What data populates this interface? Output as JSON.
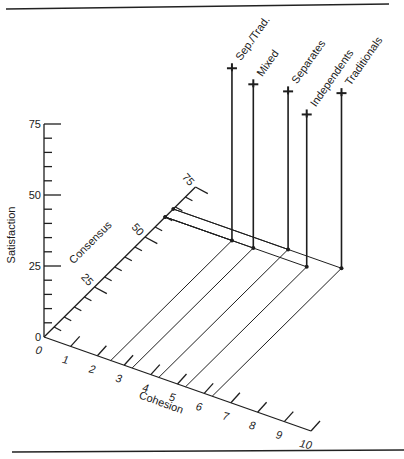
{
  "chart_data": {
    "type": "scatter",
    "projection": "3d-oblique",
    "title": "",
    "axes": {
      "x": {
        "label": "Cohesion",
        "range": [
          0,
          10
        ],
        "ticks": [
          "0",
          "1",
          "2",
          "3",
          "4",
          "5",
          "6",
          "7",
          "8",
          "9",
          "10"
        ]
      },
      "y": {
        "label": "Consensus",
        "range": [
          0,
          75
        ],
        "ticks": [
          "25",
          "50",
          "75"
        ],
        "minor_step": 5
      },
      "z": {
        "label": "Satisfaction",
        "range": [
          0,
          75
        ],
        "ticks": [
          "0",
          "25",
          "50",
          "75"
        ],
        "minor_step": 5
      }
    },
    "series": [
      {
        "name": "Sep./Trad.",
        "cohesion": 2.5,
        "consensus": 60,
        "satisfaction": 61
      },
      {
        "name": "Mixed",
        "cohesion": 3.3,
        "consensus": 60,
        "satisfaction": 58
      },
      {
        "name": "Separates",
        "cohesion": 4.3,
        "consensus": 64,
        "satisfaction": 56
      },
      {
        "name": "Independents",
        "cohesion": 5.3,
        "consensus": 60,
        "satisfaction": 54
      },
      {
        "name": "Traditionals",
        "cohesion": 6.3,
        "consensus": 64,
        "satisfaction": 62
      }
    ],
    "grid": false,
    "legend": "direct labels at top of each drop line"
  },
  "labels": {
    "satisfaction": "Satisfaction",
    "consensus": "Consensus",
    "cohesion": "Cohesion",
    "sat_ticks": [
      "0",
      "25",
      "50",
      "75"
    ],
    "con_ticks": [
      "25",
      "50",
      "75"
    ],
    "coh_ticks": [
      "0",
      "1",
      "2",
      "3",
      "4",
      "5",
      "6",
      "7",
      "8",
      "9",
      "10"
    ],
    "series": [
      "Sep./Trad.",
      "Mixed",
      "Separates",
      "Independents",
      "Traditionals"
    ]
  }
}
